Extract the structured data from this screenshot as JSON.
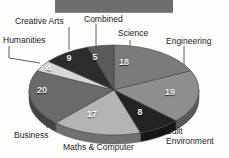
{
  "header": {
    "title": "",
    "visible": true
  },
  "chart_data": {
    "type": "pie",
    "title": "",
    "subtitle": "",
    "xlabel": "",
    "ylabel": "",
    "legend_position": "callout-labels",
    "grid": false,
    "total": 100,
    "units": "percent",
    "categories": [
      "Science",
      "Engineering",
      "Built Environment",
      "Maths & Computer",
      "Business",
      "Humanities",
      "Creative Arts",
      "Combined"
    ],
    "values": [
      18,
      19,
      8,
      17,
      20,
      4,
      9,
      5
    ],
    "colors": [
      "#7b7b7b",
      "#8e8e8e",
      "#232323",
      "#b4b4b4",
      "#6a6a6a",
      "#d6d6d6",
      "#2d2d2d",
      "#5a5a5a"
    ],
    "slices": [
      {
        "label": "Science",
        "value": 18,
        "value_text": "18",
        "color": "#7b7b7b",
        "value_x": 124,
        "value_y": 62,
        "label_x": 118,
        "label_y": 28,
        "label_align": "left",
        "leader": {
          "x1": 130,
          "y1": 40,
          "x2": 130,
          "y2": 55
        }
      },
      {
        "label": "Engineering",
        "value": 19,
        "value_text": "19",
        "color": "#8e8e8e",
        "value_x": 170,
        "value_y": 92,
        "label_x": 166,
        "label_y": 36,
        "label_align": "left",
        "leader": {
          "x1": 184,
          "y1": 46,
          "x2": 184,
          "y2": 92,
          "x3": 176,
          "y3": 92
        }
      },
      {
        "label": "Built Environment",
        "value": 8,
        "value_text": "8",
        "color": "#232323",
        "value_x": 140,
        "value_y": 112,
        "label_x": 166,
        "label_y": 127,
        "label_align": "left",
        "leader": {
          "x1": 144,
          "y1": 120,
          "x2": 144,
          "y2": 131,
          "x3": 163,
          "y3": 131
        }
      },
      {
        "label": "Maths & Computer",
        "value": 17,
        "value_text": "17",
        "color": "#b4b4b4",
        "value_x": 92,
        "value_y": 114,
        "label_x": 63,
        "label_y": 143,
        "label_align": "left",
        "leader": {
          "x1": 93,
          "y1": 126,
          "x2": 93,
          "y2": 140
        }
      },
      {
        "label": "Business",
        "value": 20,
        "value_text": "20",
        "color": "#6a6a6a",
        "value_x": 42,
        "value_y": 90,
        "label_x": 14,
        "label_y": 130,
        "label_align": "left",
        "leader": {
          "x1": 47,
          "y1": 118,
          "x2": 47,
          "y2": 128
        }
      },
      {
        "label": "Humanities",
        "value": 4,
        "value_text": "4",
        "color": "#d6d6d6",
        "value_x": 49,
        "value_y": 68,
        "label_x": 3,
        "label_y": 35,
        "label_align": "left",
        "leader": {
          "x1": 9,
          "y1": 46,
          "x2": 9,
          "y2": 58,
          "x3": 40,
          "y3": 63
        }
      },
      {
        "label": "Creative Arts",
        "value": 9,
        "value_text": "9",
        "color": "#2d2d2d",
        "value_x": 69,
        "value_y": 58,
        "label_x": 15,
        "label_y": 16,
        "label_align": "left",
        "leader": {
          "x1": 69,
          "y1": 27,
          "x2": 69,
          "y2": 50
        }
      },
      {
        "label": "Combined",
        "value": 5,
        "value_text": "5",
        "color": "#5a5a5a",
        "value_x": 95,
        "value_y": 57,
        "label_x": 84,
        "label_y": 14,
        "label_align": "left",
        "leader": {
          "x1": 96,
          "y1": 24,
          "x2": 96,
          "y2": 50
        }
      }
    ],
    "geometry": {
      "center_x": 114,
      "center_y": 90,
      "radius_x": 85,
      "radius_y": 45,
      "start_angle_deg": -90
    }
  }
}
